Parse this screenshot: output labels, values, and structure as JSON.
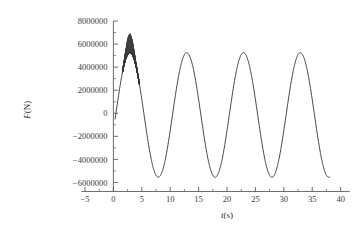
{
  "chart_data": {
    "type": "line",
    "title": "",
    "xlabel": "t(s)",
    "ylabel": "F(N)",
    "xlim": [
      -5,
      42
    ],
    "ylim": [
      -7000000,
      8000000
    ],
    "grid": false,
    "legend": "none",
    "x_ticks": [
      -5,
      0,
      5,
      10,
      15,
      20,
      25,
      30,
      35,
      40
    ],
    "x_tick_labels": [
      "-5",
      "0",
      "5",
      "10",
      "15",
      "20",
      "25",
      "30",
      "35",
      "40"
    ],
    "x_minor_step": 2.5,
    "y_ticks": [
      -6000000,
      -4000000,
      -2000000,
      0,
      2000000,
      4000000,
      6000000,
      8000000
    ],
    "y_tick_labels": [
      "-6000000",
      "-4000000",
      "-2000000",
      "0",
      "2000000",
      "4000000",
      "6000000",
      "8000000"
    ],
    "y_minor_step": 1000000,
    "series": [
      {
        "name": "F(t)",
        "color": "#2b2b2b",
        "description": "Damped-start sinusoidal force, period 10 s, amplitude 5.4e6 N, with high-frequency oscillation burst superimposed on the first peak",
        "period_s": 10,
        "amplitude_N": 5400000,
        "start_t_s": 0.3,
        "start_F_N": -5300000,
        "end_t_s": 38.1,
        "end_F_N": -5550000,
        "peaks_t_s": [
          2.9,
          12.8,
          22.8,
          32.8
        ],
        "peaks_F_N": [
          5450000,
          5420000,
          5410000,
          5400000
        ],
        "troughs_t_s": [
          7.7,
          17.7,
          27.7,
          37.8
        ],
        "troughs_F_N": [
          -5720000,
          -5700000,
          -5700000,
          -5620000
        ],
        "noise_burst": {
          "t_start_s": 1.6,
          "t_end_s": 4.6,
          "t_center_s": 2.9,
          "max_F_N": 6800000,
          "min_envelope_F_N": 4200000
        }
      }
    ]
  },
  "axes": {
    "x_axis_name": "t(s)",
    "y_axis_name": "F(N)",
    "y_axis_symbol": "F",
    "y_axis_unit": "(N)",
    "x_axis_symbol": "t",
    "x_axis_unit": "(s)"
  },
  "style": {
    "background": "#ffffff",
    "line_color": "#2b2b2b",
    "axis_color": "#5a5a5a",
    "text_color": "#3a3a3a"
  }
}
